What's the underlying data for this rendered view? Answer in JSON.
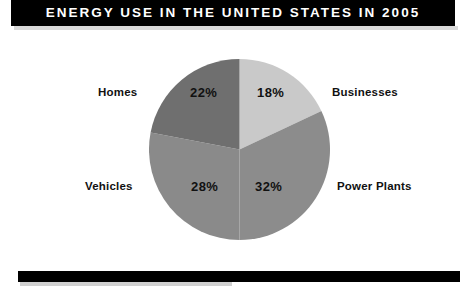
{
  "header": {
    "title": "ENERGY USE IN THE UNITED STATES IN 2005",
    "bar_color": "#000000",
    "text_color": "#ffffff"
  },
  "footer": {
    "bar_color": "#000000"
  },
  "chart_data": {
    "type": "pie",
    "title": "ENERGY USE IN THE UNITED STATES IN 2005",
    "xlabel": "",
    "ylabel": "",
    "unit": "%",
    "total": 100,
    "start_angle_deg": 0,
    "direction": "clockwise",
    "legend": "none",
    "grid": false,
    "data_labels_inside": true,
    "categories": [
      "Businesses",
      "Power Plants",
      "Vehicles",
      "Homes"
    ],
    "values": [
      18,
      32,
      28,
      22
    ],
    "slices": [
      {
        "label": "Businesses",
        "value": 18,
        "value_text": "18%",
        "color": "#c9c9c9",
        "start_deg": 0,
        "end_deg": 64.8
      },
      {
        "label": "Power Plants",
        "value": 32,
        "value_text": "32%",
        "color": "#8c8c8c",
        "start_deg": 64.8,
        "end_deg": 180
      },
      {
        "label": "Vehicles",
        "value": 28,
        "value_text": "28%",
        "color": "#8a8a8a",
        "start_deg": 180,
        "end_deg": 280.8
      },
      {
        "label": "Homes",
        "value": 22,
        "value_text": "22%",
        "color": "#6f6f6f",
        "start_deg": 280.8,
        "end_deg": 360
      }
    ]
  }
}
